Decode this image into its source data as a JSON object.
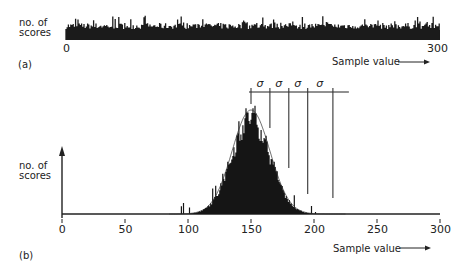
{
  "chart_data": [
    {
      "panel": "a",
      "type": "bar",
      "title": "",
      "panel_label": "(a)",
      "ylabel": "no. of scores",
      "xlabel": "Sample value",
      "xlim": [
        0,
        300
      ],
      "x_tick_labels": [
        "0",
        "300"
      ],
      "distribution": "uniform",
      "grid": false,
      "description": "Roughly flat histogram of scores across sample values 0-300"
    },
    {
      "panel": "b",
      "type": "bar",
      "title": "",
      "panel_label": "(b)",
      "ylabel": "no. of scores",
      "xlabel": "Sample value",
      "xlim": [
        0,
        300
      ],
      "x_ticks": [
        0,
        50,
        100,
        150,
        200,
        250,
        300
      ],
      "x_tick_labels": [
        "0",
        "50",
        "100",
        "150",
        "200",
        "250",
        "300"
      ],
      "distribution": "normal",
      "mean": 150,
      "sigma": 15,
      "grid": false,
      "annotations": {
        "sigma_labels": [
          "σ",
          "σ",
          "σ",
          "σ"
        ],
        "sigma_marker_positions": [
          150,
          165,
          180,
          195,
          215
        ]
      },
      "description": "Bell-shaped histogram centered at ~150 with std dev markers"
    }
  ],
  "panel_a": {
    "ylabel_line1": "no. of",
    "ylabel_line2": "scores",
    "tick_0": "0",
    "tick_300": "300",
    "xlabel": "Sample value",
    "arrow": "⟶",
    "label": "(a)"
  },
  "panel_b": {
    "ylabel_line1": "no. of",
    "ylabel_line2": "scores",
    "ticks": [
      "0",
      "50",
      "100",
      "150",
      "200",
      "250",
      "300"
    ],
    "xlabel": "Sample value",
    "arrow": "⟶",
    "label": "(b)",
    "sigma": [
      "σ",
      "σ",
      "σ",
      "σ"
    ]
  }
}
